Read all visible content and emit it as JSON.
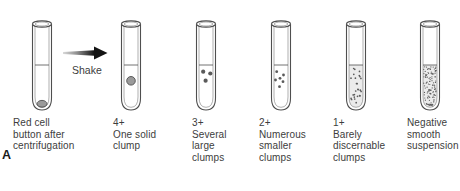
{
  "figure": {
    "panel_label": "A",
    "shake_arrow": {
      "label": "Shake",
      "direction": "right"
    },
    "tubes": [
      {
        "id": "centrifuged",
        "content": "red-cell-button-at-bottom",
        "label_lines": [
          "Red cell",
          "button after",
          "centrifugation"
        ]
      },
      {
        "id": "grade-4plus",
        "grade": "4+",
        "content": "one-solid-clump",
        "clump_count": 1,
        "label_lines": [
          "4+",
          "One solid",
          "clump"
        ]
      },
      {
        "id": "grade-3plus",
        "grade": "3+",
        "content": "several-large-clumps",
        "clump_count": 3,
        "label_lines": [
          "3+",
          "Several",
          "large",
          "clumps"
        ]
      },
      {
        "id": "grade-2plus",
        "grade": "2+",
        "content": "numerous-smaller-clumps",
        "clump_count": 6,
        "label_lines": [
          "2+",
          "Numerous",
          "smaller",
          "clumps"
        ]
      },
      {
        "id": "grade-1plus",
        "grade": "1+",
        "content": "barely-discernable-clumps",
        "label_lines": [
          "1+",
          "Barely",
          "discernable",
          "clumps"
        ]
      },
      {
        "id": "negative",
        "grade": "Negative",
        "content": "smooth-suspension",
        "label_lines": [
          "Negative",
          "smooth",
          "suspension"
        ]
      }
    ],
    "colors": {
      "outline": "#4f4f4f",
      "text": "#3d3d3d",
      "clump_fill": "#9a9a9a",
      "clump_stroke": "#4f4f4f",
      "dot": "#5a5a5a",
      "suspension_tint": "#ebebeb",
      "arrow_dark": "#141414",
      "arrow_mid": "#8f8f8f",
      "arrow_light": "#d9d9d9",
      "background": "#ffffff"
    }
  }
}
